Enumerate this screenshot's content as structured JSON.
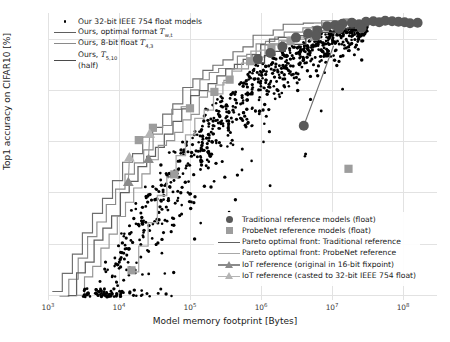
{
  "chart_data": {
    "type": "scatter",
    "title": "",
    "xlabel": "Model memory footprint [Bytes]",
    "ylabel": "Top1 accuracy on CIFAR10 [%]",
    "xscale": "log",
    "xlim": [
      1000,
      300000000
    ],
    "ylim": [
      39,
      95
    ],
    "xticks": [
      "10^3",
      "10^4",
      "10^5",
      "10^6",
      "10^7",
      "10^8"
    ],
    "xtick_values": [
      1000,
      10000,
      100000,
      1000000,
      10000000,
      100000000
    ],
    "yticks": [
      "40",
      "50",
      "60",
      "70",
      "80",
      "90"
    ],
    "ytick_values": [
      40,
      50,
      60,
      70,
      80,
      90
    ],
    "grid": true,
    "legend_position": [
      "upper left",
      "lower right"
    ],
    "series": [
      {
        "name": "Our 32-bit IEEE 754 float models",
        "marker": "dot",
        "color": "#000000"
      },
      {
        "name": "Ours, optimal format",
        "marker": "line",
        "color": "#6e6e6e"
      },
      {
        "name": "Ours, 8-bit float",
        "marker": "line",
        "color": "#8d8d8d"
      },
      {
        "name": "Ours, T(5,10) (half)",
        "marker": "line",
        "color": "#5a5a5a"
      },
      {
        "name": "Traditional reference models (float)",
        "marker": "circle",
        "color": "#595959"
      },
      {
        "name": "ProbeNet reference models (float)",
        "marker": "square",
        "color": "#9d9d9d"
      },
      {
        "name": "Pareto optimal front: Traditional reference",
        "marker": "line",
        "color": "#4a4a4a"
      },
      {
        "name": "Pareto optimal front: ProbeNet reference",
        "marker": "line",
        "color": "#a8a8a8"
      },
      {
        "name": "IoT reference (original in 16-bit fixpoint)",
        "marker": "triangle",
        "color": "#8a8a8a"
      },
      {
        "name": "IoT reference (casted to 32-bit IEEE 754 float)",
        "marker": "triangle",
        "color": "#b4b4b4"
      }
    ],
    "traditional_reference_points": [
      [
        2000000.0,
        88.4
      ],
      [
        3100000.0,
        90.2
      ],
      [
        4600000.0,
        91.0
      ],
      [
        6200000.0,
        91.6
      ],
      [
        8500000.0,
        92.4
      ],
      [
        11000000.0,
        92.6
      ],
      [
        14000000.0,
        92.9
      ],
      [
        19000000.0,
        93.1
      ],
      [
        24000000.0,
        92.8
      ],
      [
        30000000.0,
        93.3
      ],
      [
        38000000.0,
        93.4
      ],
      [
        46000000.0,
        93.2
      ],
      [
        56000000.0,
        93.5
      ],
      [
        70000000.0,
        93.4
      ],
      [
        86000000.0,
        93.3
      ],
      [
        105000000.0,
        93.2
      ],
      [
        125000000.0,
        93.0
      ],
      [
        160000000.0,
        93.1
      ],
      [
        6000000.0,
        90.6
      ],
      [
        12500000.0,
        91.9
      ],
      [
        26000000.0,
        92.1
      ],
      [
        4000000.0,
        73.0
      ],
      [
        1350000.0,
        87.2
      ],
      [
        900000.0,
        86.0
      ]
    ],
    "probenet_reference_points": [
      [
        15000.0,
        44.8
      ],
      [
        60000.0,
        63.5
      ],
      [
        220000.0,
        79.6
      ],
      [
        360000.0,
        82.0
      ],
      [
        700000.0,
        85.6
      ],
      [
        1400000.0,
        88.2
      ],
      [
        2600000.0,
        89.5
      ],
      [
        5500000.0,
        90.4
      ],
      [
        17000000.0,
        64.6
      ],
      [
        30000.0,
        72.6
      ],
      [
        100000.0,
        76.4
      ],
      [
        19000.0,
        70.2
      ]
    ],
    "iot_reference_points": [
      [
        13500.0,
        62.0
      ],
      [
        14000.0,
        66.8
      ],
      [
        26000.0,
        66.5
      ],
      [
        27000.0,
        71.4
      ]
    ],
    "scatter_description": "Dense cloud of ~900 black points spanning 10^3.5 to 10^7.5 bytes, rising from ~40% to ~93% Top1 accuracy",
    "pareto_front_ours_count": 4
  },
  "legend_top_left": {
    "items": [
      {
        "key": "dot",
        "label": "Our 32-bit IEEE 754 float models",
        "sub": ""
      },
      {
        "key": "line-dark",
        "label": "Ours, optimal format ",
        "sym": "T",
        "sub": "w,t"
      },
      {
        "key": "line-mid",
        "label": "Ours, 8-bit float ",
        "sym": "T",
        "sub": "4,3"
      },
      {
        "key": "line-dark2",
        "label": "Ours, ",
        "sym": "T",
        "sub": "5,10",
        "label2": "(half)"
      }
    ]
  },
  "legend_bottom_right": {
    "items": [
      {
        "key": "circle",
        "label": "Traditional reference models (float)"
      },
      {
        "key": "square",
        "label": "ProbeNet reference models (float)"
      },
      {
        "key": "line-dark",
        "label": "Pareto optimal front: Traditional reference"
      },
      {
        "key": "line-light",
        "label": "Pareto optimal front: ProbeNet reference"
      },
      {
        "key": "triangle-dark",
        "label": "IoT reference (original in 16-bit fixpoint)"
      },
      {
        "key": "triangle-light",
        "label": "IoT reference (casted to 32-bit IEEE 754 float)"
      }
    ]
  },
  "axes": {
    "xlabel": "Model memory footprint [Bytes]",
    "ylabel": "Top1 accuracy on CIFAR10 [%]",
    "xticks": [
      "3",
      "4",
      "5",
      "6",
      "7",
      "8"
    ],
    "xtick_base": "10",
    "yticks": [
      "90",
      "80",
      "70",
      "60",
      "50",
      "40"
    ]
  },
  "colors": {
    "scatter": "#000000",
    "traditional": "#595959",
    "probenet": "#9d9d9d",
    "iot_dark": "#8a8a8a",
    "iot_light": "#b4b4b4",
    "grid": "#e2e2e2"
  }
}
